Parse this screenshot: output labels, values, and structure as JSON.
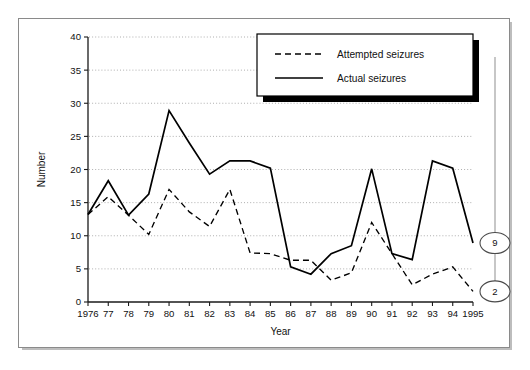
{
  "chart_data": {
    "type": "line",
    "title": "",
    "xlabel": "Year",
    "ylabel": "Number",
    "xlim": [
      1976,
      1995
    ],
    "ylim": [
      0,
      40
    ],
    "ytick_step": 5,
    "yticks": [
      0,
      5,
      10,
      15,
      20,
      25,
      30,
      35,
      40
    ],
    "grid": true,
    "grid_style": "dotted-horizontal",
    "legend_position": "top-right",
    "x": [
      1976,
      1977,
      1978,
      1979,
      1980,
      1981,
      1982,
      1983,
      1984,
      1985,
      1986,
      1987,
      1988,
      1989,
      1990,
      1991,
      1992,
      1993,
      1994,
      1995
    ],
    "xtick_labels": [
      "1976",
      "77",
      "78",
      "79",
      "80",
      "81",
      "82",
      "83",
      "84",
      "85",
      "86",
      "87",
      "88",
      "89",
      "90",
      "91",
      "92",
      "93",
      "94",
      "1995"
    ],
    "series": [
      {
        "name": "Attempted seizures",
        "style": "dashed",
        "color": "#000000",
        "values": [
          13.2,
          15.9,
          13.1,
          10.2,
          17.0,
          13.6,
          11.4,
          17.0,
          7.4,
          7.3,
          6.3,
          6.3,
          3.3,
          4.4,
          12.0,
          7.3,
          2.6,
          4.2,
          5.3,
          1.6
        ]
      },
      {
        "name": "Actual seizures",
        "style": "solid",
        "color": "#000000",
        "values": [
          13.2,
          18.3,
          13.1,
          16.3,
          28.9,
          24.0,
          19.3,
          21.3,
          21.3,
          20.2,
          5.3,
          4.2,
          7.3,
          8.5,
          20.1,
          7.3,
          6.4,
          21.3,
          20.2,
          8.9
        ]
      }
    ],
    "annotations": [
      {
        "label": "9",
        "value": 9,
        "series": "Actual seizures",
        "year": 1995,
        "shape": "ellipse"
      },
      {
        "label": "2",
        "value": 2,
        "series": "Attempted seizures",
        "year": 1995,
        "shape": "ellipse"
      }
    ]
  },
  "legend": {
    "items": [
      {
        "label": "Attempted seizures",
        "style": "dashed"
      },
      {
        "label": "Actual seizures",
        "style": "solid"
      }
    ]
  },
  "caption": {
    "text": ""
  }
}
